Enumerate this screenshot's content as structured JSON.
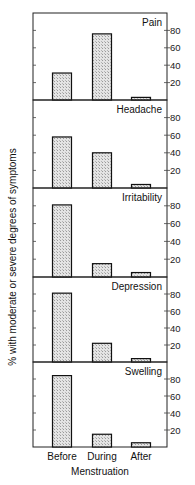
{
  "chart_data": {
    "type": "bar",
    "layout": "small-multiples-vertical",
    "ylabel": "% with moderate or severe degrees of symptoms",
    "xlabel": "Menstruation",
    "categories": [
      "Before",
      "During",
      "After"
    ],
    "ylim": [
      0,
      100
    ],
    "yticks": [
      20,
      40,
      60,
      80
    ],
    "yaxis_position": "right",
    "grid": false,
    "legend": null,
    "bar_fill": "#d9d9d9",
    "bar_stroke": "#111111",
    "panels": [
      {
        "title": "Pain",
        "values": [
          31,
          76,
          3
        ]
      },
      {
        "title": "Headache",
        "values": [
          58,
          40,
          4
        ]
      },
      {
        "title": "Irritability",
        "values": [
          81,
          15,
          5
        ]
      },
      {
        "title": "Depression",
        "values": [
          81,
          22,
          4
        ]
      },
      {
        "title": "Swelling",
        "values": [
          84,
          15,
          5
        ]
      }
    ]
  }
}
